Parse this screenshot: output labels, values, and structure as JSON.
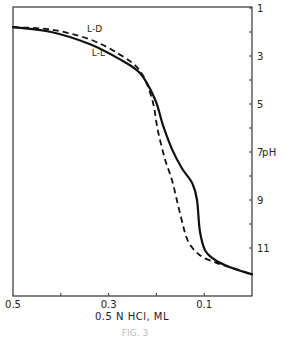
{
  "chart_data": {
    "type": "line",
    "title": "",
    "xlabel": "0.5 N HCl, ML",
    "ylabel": "pH",
    "xlim": [
      0.5,
      0.0
    ],
    "ylim": [
      1,
      13
    ],
    "x_inverted": true,
    "y_inverted": true,
    "y_axis_position": "right",
    "x_ticks": [
      {
        "value": 0.5,
        "label": "0.5"
      },
      {
        "value": 0.4,
        "label": ""
      },
      {
        "value": 0.3,
        "label": "0.3"
      },
      {
        "value": 0.2,
        "label": ""
      },
      {
        "value": 0.1,
        "label": "0.1"
      }
    ],
    "y_ticks": [
      {
        "value": 1,
        "label": "1"
      },
      {
        "value": 2,
        "label": ""
      },
      {
        "value": 3,
        "label": "3"
      },
      {
        "value": 4,
        "label": ""
      },
      {
        "value": 5,
        "label": "5"
      },
      {
        "value": 6,
        "label": ""
      },
      {
        "value": 7,
        "label": "7"
      },
      {
        "value": 8,
        "label": ""
      },
      {
        "value": 9,
        "label": "9"
      },
      {
        "value": 10,
        "label": ""
      },
      {
        "value": 11,
        "label": "11"
      }
    ],
    "grid": false,
    "legend": "inline labels",
    "series": [
      {
        "name": "L-L",
        "style": "solid",
        "x": [
          0.5,
          0.42,
          0.34,
          0.28,
          0.235,
          0.203,
          0.186,
          0.167,
          0.146,
          0.125,
          0.115,
          0.109,
          0.098,
          0.077,
          0.046,
          0.0
        ],
        "y": [
          1.8,
          2.0,
          2.5,
          3.1,
          3.7,
          4.8,
          5.9,
          6.9,
          7.7,
          8.3,
          9.0,
          10.3,
          11.1,
          11.5,
          11.8,
          12.1
        ]
      },
      {
        "name": "L-D",
        "style": "dashed",
        "x": [
          0.5,
          0.42,
          0.34,
          0.28,
          0.235,
          0.209,
          0.197,
          0.182,
          0.167,
          0.15,
          0.134,
          0.109,
          0.077,
          0.046,
          0.0
        ],
        "y": [
          1.8,
          1.9,
          2.3,
          2.9,
          3.6,
          4.8,
          6.1,
          7.3,
          8.2,
          9.6,
          10.7,
          11.3,
          11.6,
          11.8,
          12.1
        ]
      }
    ],
    "annotations": [
      {
        "text": "L-D",
        "x": 0.345,
        "y": 2.0
      },
      {
        "text": "L-L",
        "x": 0.335,
        "y": 3.0
      }
    ]
  },
  "figure": {
    "y_axis_title": "pH",
    "x_axis_title": "0.5 N HCl, ML",
    "caption": "FIG. 3"
  }
}
